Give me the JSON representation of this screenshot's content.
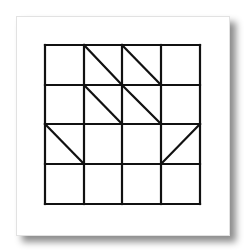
{
  "figure": {
    "rows": 4,
    "cols": 4,
    "line_color": "#111111",
    "paper_color": "#ffffff",
    "grid": {
      "x_lines": [
        45,
        84,
        122,
        161,
        200
      ],
      "y_lines": [
        45,
        85,
        124,
        164,
        204
      ]
    },
    "diagonals": [
      {
        "row": 0,
        "col": 1,
        "direction": "down-right"
      },
      {
        "row": 0,
        "col": 2,
        "direction": "down-right"
      },
      {
        "row": 1,
        "col": 1,
        "direction": "down-right"
      },
      {
        "row": 1,
        "col": 2,
        "direction": "down-right"
      },
      {
        "row": 2,
        "col": 0,
        "direction": "down-right"
      },
      {
        "row": 2,
        "col": 3,
        "direction": "up-right"
      }
    ]
  }
}
